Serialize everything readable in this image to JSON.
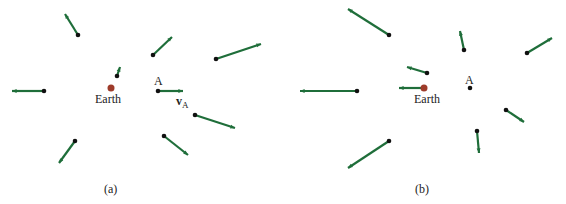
{
  "colors": {
    "arrow": "#1f6e3a",
    "point": "#111111",
    "earth": "#9e3b2a"
  },
  "panels": [
    {
      "caption": "(a)",
      "earth_label": "Earth",
      "point_label": "A",
      "velocity_label": "v",
      "velocity_sub": "A",
      "earth": [
        111,
        88
      ],
      "vectors": [
        [
          78,
          35,
          65,
          14
        ],
        [
          153,
          55,
          172,
          37
        ],
        [
          216,
          59,
          261,
          44
        ],
        [
          117,
          76,
          120,
          67
        ],
        [
          44,
          91,
          12,
          91
        ],
        [
          158,
          91,
          183,
          91
        ],
        [
          195,
          115,
          235,
          128
        ],
        [
          164,
          136,
          188,
          155
        ],
        [
          75,
          141,
          59,
          163
        ]
      ]
    },
    {
      "caption": "(b)",
      "earth_label": "Earth",
      "point_label": "A",
      "earth": [
        424,
        88
      ],
      "earth_vector": [
        424,
        88,
        399,
        88
      ],
      "point": [
        470,
        88
      ],
      "vectors": [
        [
          389,
          35,
          348,
          9
        ],
        [
          464,
          50,
          460,
          31
        ],
        [
          527,
          53,
          552,
          38
        ],
        [
          427,
          73,
          407,
          67
        ],
        [
          357,
          91,
          300,
          91
        ],
        [
          506,
          110,
          524,
          122
        ],
        [
          477,
          131,
          479,
          153
        ],
        [
          389,
          141,
          348,
          168
        ]
      ]
    }
  ]
}
